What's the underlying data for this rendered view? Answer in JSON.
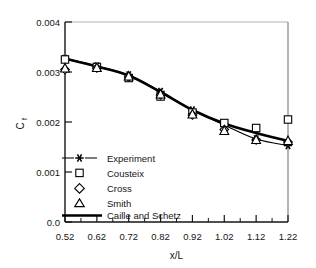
{
  "chart_data": {
    "type": "scatter",
    "title": "",
    "xlabel": "x/L",
    "ylabel": "C_f",
    "ylabel_main": "C",
    "ylabel_subscript": "f",
    "xlim": [
      0.52,
      1.22
    ],
    "ylim": [
      0.0,
      0.004
    ],
    "xticks": [
      0.52,
      0.62,
      0.72,
      0.82,
      0.92,
      1.02,
      1.12,
      1.22
    ],
    "xtick_labels": [
      "0.52",
      "0.62",
      "0.72",
      "0.82",
      "0.92",
      "1.02",
      "1.12",
      "1.22"
    ],
    "yticks": [
      0.0,
      0.001,
      0.002,
      0.003,
      0.004
    ],
    "ytick_labels": [
      "0.0",
      "0.001",
      "0.002",
      "0.003",
      "0.004"
    ],
    "x_minor_ticks": [
      0.57,
      0.67,
      0.77,
      0.87,
      0.97,
      1.07,
      1.17
    ],
    "grid": false,
    "legend_position": "lower-left-inside",
    "x": [
      0.52,
      0.62,
      0.72,
      0.82,
      0.92,
      1.02,
      1.12,
      1.22
    ],
    "series": [
      {
        "name": "Experiment",
        "marker": "star",
        "line": "thin",
        "values": [
          0.00327,
          0.00312,
          0.00294,
          0.00261,
          0.00224,
          0.00194,
          0.00166,
          0.00153
        ]
      },
      {
        "name": "Cousteix",
        "marker": "square",
        "line": "none",
        "values": [
          0.00325,
          0.0031,
          0.00288,
          0.00251,
          0.00219,
          0.00198,
          0.00188,
          0.00205
        ]
      },
      {
        "name": "Cross",
        "marker": "diamond",
        "line": "none",
        "values": [
          0.00305,
          0.00308,
          0.0029,
          0.00254,
          0.00214,
          0.00185,
          0.00164,
          0.0016
        ]
      },
      {
        "name": "Smith",
        "marker": "triangle",
        "line": "none",
        "values": [
          0.00308,
          0.00309,
          0.00292,
          0.00256,
          0.00216,
          0.00183,
          0.00165,
          0.00163
        ]
      },
      {
        "name": "Caille and Schetz",
        "marker": "none",
        "line": "thick",
        "values": [
          0.00327,
          0.00311,
          0.00293,
          0.0026,
          0.00224,
          0.00197,
          0.00178,
          0.00162
        ]
      }
    ]
  },
  "legend": {
    "items": [
      {
        "label": "Experiment",
        "key": "experiment"
      },
      {
        "label": "Cousteix",
        "key": "cousteix"
      },
      {
        "label": "Cross",
        "key": "cross"
      },
      {
        "label": "Smith",
        "key": "smith"
      },
      {
        "label": "Caille and Schetz",
        "key": "caille-and-schetz"
      }
    ]
  },
  "axes": {
    "x_title": "x/L",
    "y_title_main": "C",
    "y_title_sub": "f",
    "x_tick_labels": [
      "0.52",
      "0.62",
      "0.72",
      "0.82",
      "0.92",
      "1.02",
      "1.12",
      "1.22"
    ],
    "y_tick_labels": [
      "0.0",
      "0.001",
      "0.002",
      "0.003",
      "0.004"
    ]
  },
  "colors": {
    "axis": "#1a1a1a",
    "marker": "#000000",
    "background": "#ffffff"
  }
}
